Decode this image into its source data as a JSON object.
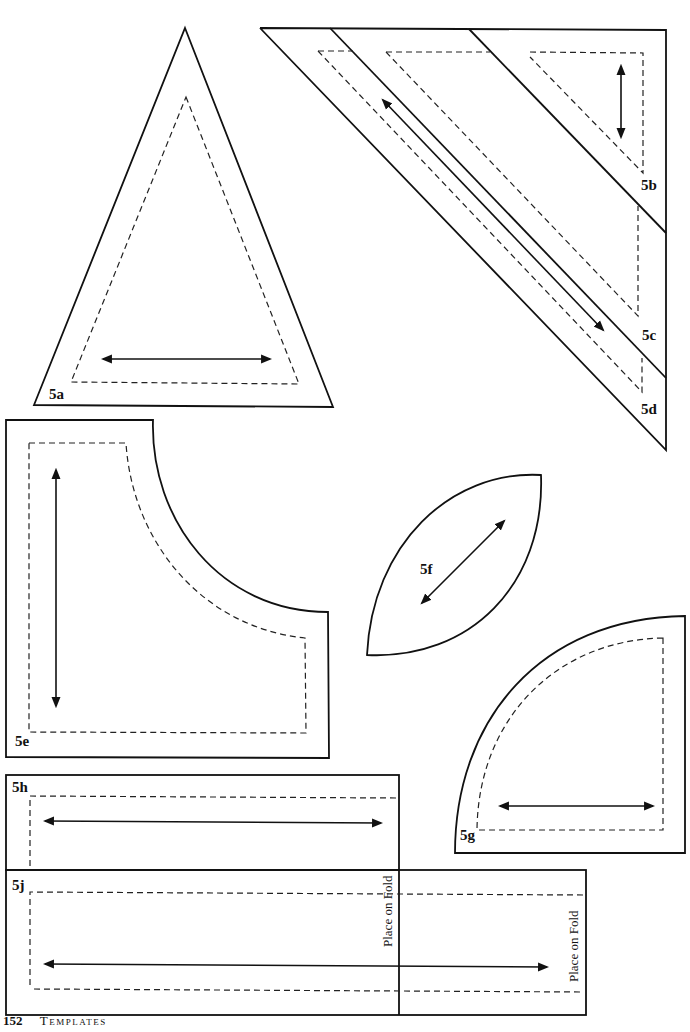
{
  "page": {
    "number": "152",
    "section": "Templates"
  },
  "templates": [
    {
      "id": "5a",
      "label": "5a",
      "shape": "triangle"
    },
    {
      "id": "5b",
      "label": "5b",
      "shape": "right-triangle"
    },
    {
      "id": "5c",
      "label": "5c",
      "shape": "parallelogram"
    },
    {
      "id": "5d",
      "label": "5d",
      "shape": "parallelogram-strip"
    },
    {
      "id": "5e",
      "label": "5e",
      "shape": "concave-corner"
    },
    {
      "id": "5f",
      "label": "5f",
      "shape": "leaf"
    },
    {
      "id": "5g",
      "label": "5g",
      "shape": "quarter-circle"
    },
    {
      "id": "5h",
      "label": "5h",
      "shape": "rectangle"
    },
    {
      "id": "5j",
      "label": "5j",
      "shape": "rectangle-on-fold"
    }
  ],
  "annotations": {
    "fold_5h": "Place on Fold",
    "fold_5j": "Place on Fold"
  },
  "colors": {
    "line": "#111111",
    "background": "#ffffff"
  }
}
